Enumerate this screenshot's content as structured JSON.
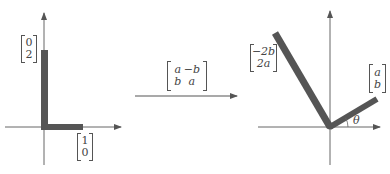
{
  "diagram": {
    "colors": {
      "bar": "#555555",
      "axis": "#666666",
      "text": "#444444"
    },
    "left": {
      "vector_e2_scaled": {
        "top": "0",
        "bottom": "2"
      },
      "vector_e1": {
        "top": "1",
        "bottom": "0"
      }
    },
    "transform": {
      "matrix": {
        "r1c1": "a",
        "r1c2": "−b",
        "r2c1": "b",
        "r2c2": "a"
      }
    },
    "right": {
      "vector_image_e2": {
        "top": "−2b",
        "bottom": "2a"
      },
      "vector_image_e1": {
        "top": "a",
        "bottom": "b"
      },
      "angle_label": "θ"
    }
  }
}
